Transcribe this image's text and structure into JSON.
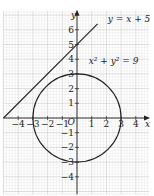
{
  "chart_data": {
    "type": "line",
    "title": "",
    "xlabel": "x",
    "ylabel": "y",
    "xlim": [
      -5.0,
      4.9
    ],
    "ylim": [
      -5.2,
      7.3
    ],
    "grid": true,
    "origin_label": "O",
    "x_ticks": [
      -4,
      -3,
      -2,
      -1,
      1,
      2,
      3,
      4
    ],
    "x_tick_labels": [
      "−4",
      "−3",
      "−2",
      "−1",
      "1",
      "2",
      "3",
      "4"
    ],
    "y_ticks": [
      6,
      5,
      4,
      3,
      2,
      1,
      -1,
      -2,
      -3,
      -4
    ],
    "y_tick_labels": [
      "6",
      "5",
      "4",
      "3",
      "2",
      "1",
      "−1",
      "−2",
      "−3",
      "−4"
    ],
    "series": [
      {
        "name": "y = x + 5",
        "kind": "line",
        "slope": 1,
        "intercept": 5,
        "x_range": [
          -5,
          1.4
        ],
        "label": "y = x + 5",
        "label_position": [
          2.1,
          6.5
        ]
      },
      {
        "name": "x² + y² = 9",
        "kind": "circle",
        "center": [
          0,
          0
        ],
        "radius": 3,
        "label": "x² + y² = 9",
        "label_position": [
          0.8,
          3.7
        ]
      }
    ]
  },
  "colors": {
    "grid_minor": "#e4e4e4",
    "grid_major": "#c8c8c8",
    "axis": "#222222",
    "curve": "#222222"
  },
  "layout": {
    "origin_px": [
      77,
      118
    ],
    "unit_px": 14.7
  }
}
